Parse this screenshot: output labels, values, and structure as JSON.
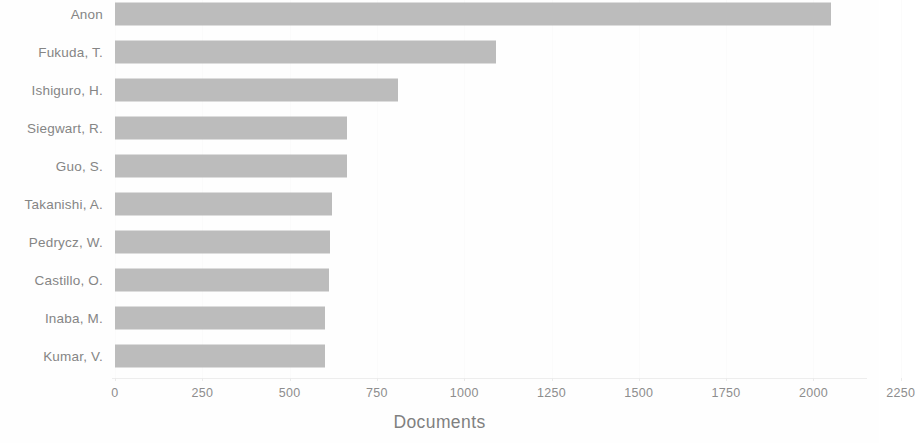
{
  "chart_data": {
    "type": "bar",
    "orientation": "horizontal",
    "title": "",
    "subtitle": "",
    "xlabel": "Documents",
    "ylabel": "",
    "categories": [
      "Anon",
      "Fukuda, T.",
      "Ishiguro, H.",
      "Siegwart, R.",
      "Guo, S.",
      "Takanishi, A.",
      "Pedrycz, W.",
      "Castillo, O.",
      "Inaba, M.",
      "Kumar, V."
    ],
    "values": [
      2050,
      1090,
      810,
      665,
      665,
      620,
      615,
      612,
      602,
      600
    ],
    "xlim": [
      0,
      2250
    ],
    "xticks": [
      0,
      250,
      500,
      750,
      1000,
      1250,
      1500,
      1750,
      2000,
      2250
    ],
    "xtick_labels": [
      "0",
      "250",
      "500",
      "750",
      "1000",
      "1250",
      "1500",
      "1750",
      "2000",
      "2250"
    ],
    "yticks": [],
    "grid": false,
    "legend": null,
    "legend_position": "none",
    "series": [
      {
        "name": "Documents",
        "values": [
          2050,
          1090,
          810,
          665,
          665,
          620,
          615,
          612,
          602,
          600
        ]
      }
    ],
    "annotations": [],
    "colors": {
      "bar_fill": "#bcbcbc",
      "axis_text": "#8d8d8d",
      "category_text": "#858585",
      "axis_title_text": "#808080",
      "background": "#fefefe",
      "axis_line": "#ededed"
    }
  }
}
